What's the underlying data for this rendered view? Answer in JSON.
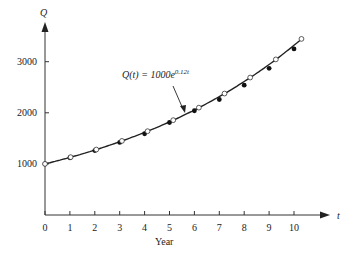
{
  "chart_data": {
    "type": "scatter",
    "title": "",
    "xlabel": "Year",
    "ylabel": "Q",
    "x_axis_var": "t",
    "xlim": [
      0,
      10.6
    ],
    "ylim": [
      0,
      3700
    ],
    "x_ticks": [
      0,
      1,
      2,
      3,
      4,
      5,
      6,
      7,
      8,
      9,
      10
    ],
    "y_ticks": [
      1000,
      2000,
      3000
    ],
    "grid": false,
    "annotation": {
      "text": "Q(t) = 1000e",
      "exponent": "0.12t"
    },
    "series": [
      {
        "name": "Q(t) = 1000e^{0.12t}",
        "style": "curve",
        "function": "1000*exp(0.12*t)"
      },
      {
        "name": "model points (open)",
        "style": "open-circle",
        "x": [
          0,
          1.03,
          2.06,
          3.09,
          4.12,
          5.15,
          6.18,
          7.21,
          8.24,
          9.27,
          10.3
        ],
        "y": [
          1000,
          1132,
          1281,
          1450,
          1640,
          1856,
          2101,
          2377,
          2690,
          3045,
          3446
        ]
      },
      {
        "name": "observed (filled)",
        "style": "filled-dot",
        "x": [
          0,
          1,
          2,
          3,
          4,
          5,
          6,
          7,
          8,
          9,
          10
        ],
        "y": [
          1000,
          1120,
          1260,
          1420,
          1590,
          1810,
          2040,
          2260,
          2540,
          2870,
          3250
        ]
      }
    ]
  }
}
